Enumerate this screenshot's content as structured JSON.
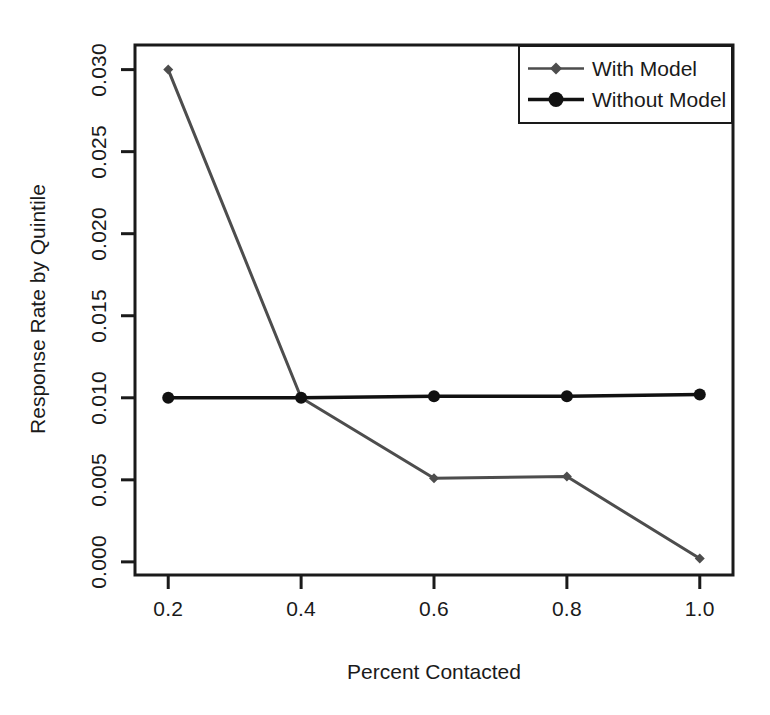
{
  "chart_data": {
    "type": "line",
    "title": "",
    "subtitle": "",
    "xlabel": "Percent Contacted",
    "ylabel": "Response Rate by Quintile",
    "x": [
      0.2,
      0.4,
      0.6,
      0.8,
      1.0
    ],
    "xlim": [
      0.15,
      1.05
    ],
    "ylim": [
      -0.0008,
      0.0315
    ],
    "grid": false,
    "legend_position": "top-right",
    "xticks": [
      "0.2",
      "0.4",
      "0.6",
      "0.8",
      "1.0"
    ],
    "xtick_values": [
      0.2,
      0.4,
      0.6,
      0.8,
      1.0
    ],
    "yticks": [
      "0.000",
      "0.005",
      "0.010",
      "0.015",
      "0.020",
      "0.025",
      "0.030"
    ],
    "ytick_values": [
      0.0,
      0.005,
      0.01,
      0.015,
      0.02,
      0.025,
      0.03
    ],
    "series": [
      {
        "name": "With Model",
        "values": [
          0.03,
          0.01,
          0.0051,
          0.0052,
          0.0002
        ],
        "color": "#4d4d4d",
        "marker": "diamond",
        "marker_size": 7,
        "line_width": 3
      },
      {
        "name": "Without Model",
        "values": [
          0.01,
          0.01,
          0.0101,
          0.0101,
          0.0102
        ],
        "color": "#111111",
        "marker": "circle",
        "marker_size": 11,
        "line_width": 3.5
      }
    ]
  },
  "legend": {
    "entries": [
      {
        "label": "With Model"
      },
      {
        "label": "Without Model"
      }
    ]
  },
  "axes": {
    "frame_color": "#1a1a1a",
    "x_title": "Percent Contacted",
    "y_title": "Response Rate by Quintile"
  }
}
